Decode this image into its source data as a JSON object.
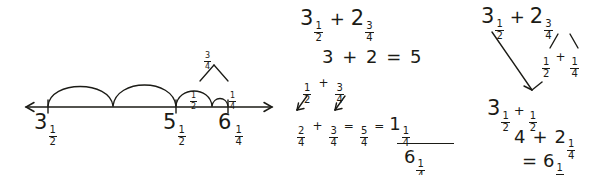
{
  "page": {
    "background_color": "#ffffff",
    "ink_color": "#1b1b16"
  },
  "number_line": {
    "name": "number-line-model",
    "axis": {
      "left_arrow": true,
      "right_arrow": true,
      "y": 107,
      "x_start": 26,
      "x_end": 272
    },
    "ticks": [
      {
        "label_whole": "3",
        "label_frac_num": "1",
        "label_frac_den": "2",
        "x": 48
      },
      {
        "label_whole": "5",
        "label_frac_num": "1",
        "label_frac_den": "2",
        "x": 176
      },
      {
        "label_whole": "6",
        "label_frac_num": "1",
        "label_frac_den": "4",
        "x": 228
      }
    ],
    "hops": [
      {
        "from_x": 48,
        "to_x": 113,
        "label": "",
        "size": "1"
      },
      {
        "from_x": 113,
        "to_x": 176,
        "label": "",
        "size": "1"
      },
      {
        "from_x": 176,
        "to_x": 212,
        "label_num": "1",
        "label_den": "2",
        "size": "1/2"
      },
      {
        "from_x": 212,
        "to_x": 228,
        "label_num": "1",
        "label_den": "4",
        "size": "1/4"
      }
    ],
    "decomposition": {
      "top_num": "3",
      "top_den": "4",
      "left_num": "1",
      "left_den": "2",
      "right_num": "1",
      "right_den": "4"
    }
  },
  "column_middle": {
    "name": "break-apart-method",
    "line1": {
      "whole1": "3",
      "num1": "1",
      "den1": "2",
      "op": "+",
      "whole2": "2",
      "num2": "3",
      "den2": "4"
    },
    "line2": {
      "text": "3 + 2  =  5"
    },
    "line3": {
      "num1": "1",
      "den1": "2",
      "op": "+",
      "num2": "3",
      "den2": "4"
    },
    "line4": {
      "num1": "2",
      "den1": "4",
      "op1": "+",
      "num2": "3",
      "den2": "4",
      "eq1": "=",
      "num3": "5",
      "den3": "4",
      "eq2": "=",
      "whole": "1",
      "num4": "1",
      "den4": "4"
    },
    "answer": {
      "whole": "6",
      "num": "1",
      "den": "4"
    }
  },
  "column_right": {
    "name": "decompose-method",
    "line1": {
      "whole1": "3",
      "num1": "1",
      "den1": "2",
      "op": "+",
      "whole2": "2",
      "num2": "3",
      "den2": "4"
    },
    "line2": {
      "num1": "1",
      "den1": "2",
      "op": "+",
      "num2": "1",
      "den2": "4"
    },
    "line3": {
      "whole1": "3",
      "num1": "1",
      "den1": "2",
      "op": "+",
      "num2": "1",
      "den2": "2"
    },
    "line4": {
      "whole1": "4",
      "op": "+",
      "whole2": "2",
      "num2": "1",
      "den2": "4"
    },
    "line5": {
      "eq": "=",
      "whole": "6",
      "num": "1",
      "den": "4"
    }
  }
}
